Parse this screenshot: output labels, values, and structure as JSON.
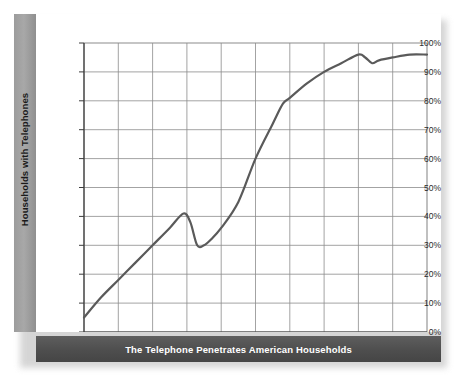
{
  "figure": {
    "caption": "The Telephone Penetrates American Households",
    "y_axis_title": "Households with Telephones"
  },
  "colors": {
    "line": "#5a5a5a",
    "grid": "#8c8c8c",
    "axis": "#3c3c3c",
    "caption_bar": "#4e4e4e",
    "side_band": "#9c9c9c",
    "background": "#ffffff"
  },
  "chart_data": {
    "type": "line",
    "title": "The Telephone Penetrates American Households",
    "xlabel": "",
    "ylabel": "Households with Telephones",
    "xlim": [
      1900,
      2000
    ],
    "ylim": [
      0,
      100
    ],
    "grid": true,
    "legend": null,
    "xticks": [
      1900,
      1910,
      1920,
      1930,
      1940,
      1950,
      1960,
      1970,
      1980,
      1990,
      2000
    ],
    "xtick_labels": [
      "1900",
      "1910",
      "1920",
      "1930",
      "1940",
      "1950",
      "1960",
      "1970",
      "1980",
      "1990",
      "2000"
    ],
    "yticks": [
      0,
      10,
      20,
      30,
      40,
      50,
      60,
      70,
      80,
      90,
      100
    ],
    "ytick_labels": [
      "0%",
      "10%",
      "20%",
      "30%",
      "40%",
      "50%",
      "60%",
      "70%",
      "80%",
      "90%",
      "100%"
    ],
    "series": [
      {
        "name": "Households with Telephones",
        "x": [
          1900,
          1905,
          1910,
          1915,
          1920,
          1925,
          1929,
          1931,
          1933,
          1935,
          1937,
          1940,
          1945,
          1950,
          1955,
          1958,
          1960,
          1965,
          1970,
          1975,
          1980,
          1982,
          1984,
          1986,
          1990,
          1995,
          2000
        ],
        "values": [
          5,
          12,
          18,
          24,
          30,
          36,
          41,
          38,
          30,
          30,
          32,
          36,
          45,
          60,
          72,
          79,
          81,
          86,
          90,
          93,
          96,
          95,
          93,
          94,
          95,
          96,
          96
        ]
      }
    ],
    "annotations": [
      {
        "label": "1929 peak",
        "x": 1929,
        "y": 41
      },
      {
        "label": "Depression trough",
        "x": 1934,
        "y": 30
      },
      {
        "label": "1980s plateau",
        "x": 1984,
        "y": 93
      }
    ]
  }
}
